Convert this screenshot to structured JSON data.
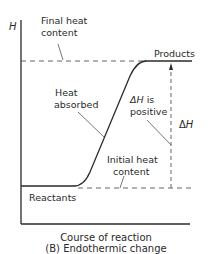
{
  "diagram": {
    "title": "(B) Endothermic change",
    "type": "energy-profile",
    "axes": {
      "y_label": "H",
      "x_label": "Course of reaction"
    },
    "labels": {
      "final_heat_line1": "Final heat",
      "final_heat_line2": "content",
      "products": "Products",
      "heat_absorbed_line1": "Heat",
      "heat_absorbed_line2": "absorbed",
      "delta_h_is_line1": "ΔH is",
      "delta_h_is_line2": "positive",
      "delta_h": "ΔH",
      "initial_heat_line1": "Initial heat",
      "initial_heat_line2": "content",
      "reactants": "Reactants"
    },
    "caption": {
      "line1": "Course of reaction",
      "line2": "(B) Endothermic change"
    },
    "levels": {
      "reactants_energy": "low",
      "products_energy": "high",
      "delta_h_sign": "positive"
    },
    "colors": {
      "line": "#2a2a2a",
      "background": "#ffffff"
    }
  }
}
